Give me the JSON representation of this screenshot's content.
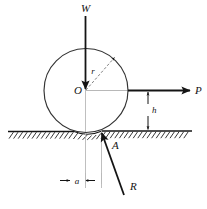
{
  "figure": {
    "background_color": "#ffffff",
    "stroke_color": "#141414",
    "construction_line_color": "#b3b3b3",
    "labels": {
      "weight": "W",
      "applied_force": "P",
      "reaction_force": "R",
      "radius": "r",
      "center": "O",
      "contact_point": "A",
      "height": "h",
      "offset": "a"
    },
    "geometry": {
      "circle_center_x": 86,
      "circle_center_y": 91,
      "circle_radius": 42,
      "ground_y": 131,
      "contact_point_x": 102,
      "contact_point_y": 131
    },
    "elements": [
      {
        "name": "wheel-circle",
        "type": "circle"
      },
      {
        "name": "ground-surface",
        "type": "hatched-line"
      },
      {
        "name": "weight-force-arrow",
        "type": "arrow",
        "direction": "down"
      },
      {
        "name": "applied-force-arrow",
        "type": "arrow",
        "direction": "right"
      },
      {
        "name": "reaction-force-arrow",
        "type": "arrow",
        "direction": "up-left"
      },
      {
        "name": "radius-arrow",
        "type": "arrow",
        "direction": "up-right"
      },
      {
        "name": "height-dimension",
        "type": "dimension"
      },
      {
        "name": "offset-dimension",
        "type": "dimension"
      }
    ]
  }
}
